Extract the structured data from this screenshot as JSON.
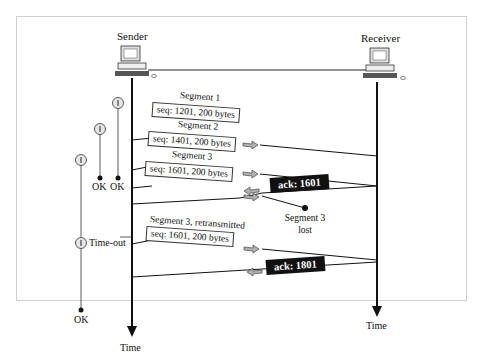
{
  "diagram": {
    "sender_label": "Sender",
    "receiver_label": "Receiver",
    "time_label_left": "Time",
    "time_label_right": "Time",
    "segments": [
      {
        "title": "Segment 1",
        "box": "seq: 1201, 200 bytes"
      },
      {
        "title": "Segment 2",
        "box": "seq: 1401, 200 bytes"
      },
      {
        "title": "Segment 3",
        "box": "seq: 1601, 200 bytes"
      },
      {
        "title": "Segment 3, retransmitted",
        "box": "seq: 1601, 200 bytes"
      }
    ],
    "acks": [
      {
        "label": "ack: 1601"
      },
      {
        "label": "ack: 1801"
      }
    ],
    "lost_label_line1": "Segment 3",
    "lost_label_line2": "lost",
    "timers": {
      "ok1": "OK",
      "ok2": "OK",
      "timeout": "Time-out",
      "ok3": "OK"
    },
    "colors": {
      "line": "#111111",
      "arrow_fill": "#a8a8a8",
      "ack_bg": "#111111",
      "timer_fill": "#e6e6e6"
    }
  }
}
